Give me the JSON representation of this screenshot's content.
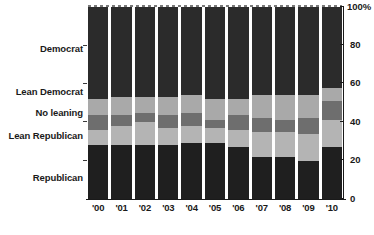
{
  "chart_data": {
    "type": "bar",
    "subtype": "stacked-bar-100-percent",
    "title": "",
    "subtitle": "",
    "xlabel": "",
    "ylabel": "",
    "ylim": [
      0,
      100
    ],
    "grid": false,
    "legend_position": "left-axis-inline",
    "categories": [
      "'00",
      "'01",
      "'02",
      "'03",
      "'04",
      "'05",
      "'06",
      "'07",
      "'08",
      "'09",
      "'10"
    ],
    "y_ticks": [
      "0",
      "20",
      "40",
      "60",
      "80",
      "100%"
    ],
    "y_tick_values": [
      0,
      20,
      40,
      60,
      80,
      100
    ],
    "stack_order_bottom_to_top": [
      "Republican",
      "Lean Republican",
      "No leaning",
      "Lean Democrat",
      "Democrat"
    ],
    "series": [
      {
        "name": "Republican",
        "color": "#1f1f1f",
        "values": [
          28,
          28,
          28,
          28,
          29,
          29,
          27,
          22,
          22,
          20,
          27
        ]
      },
      {
        "name": "Lean Republican",
        "color": "#b4b4b4",
        "values": [
          8,
          10,
          12,
          9,
          9,
          8,
          9,
          13,
          13,
          14,
          14
        ]
      },
      {
        "name": "No leaning",
        "color": "#6e6e6e",
        "values": [
          8,
          6,
          5,
          7,
          7,
          4,
          8,
          7,
          6,
          8,
          10
        ]
      },
      {
        "name": "Lean Democrat",
        "color": "#a9a9a9",
        "values": [
          8,
          9,
          8,
          9,
          9,
          11,
          8,
          12,
          13,
          12,
          7
        ]
      },
      {
        "name": "Democrat",
        "color": "#2b2b2b",
        "values": [
          48,
          47,
          47,
          47,
          46,
          48,
          48,
          46,
          46,
          46,
          42
        ]
      }
    ],
    "category_labels": [
      {
        "name": "Democrat",
        "top_percent": 75
      },
      {
        "name": "Lean Democrat",
        "top_percent": 58
      },
      {
        "name": "No leaning",
        "top_percent": 48
      },
      {
        "name": "Lean Republican",
        "top_percent": 38
      },
      {
        "name": "Republican",
        "top_percent": 14
      }
    ]
  }
}
